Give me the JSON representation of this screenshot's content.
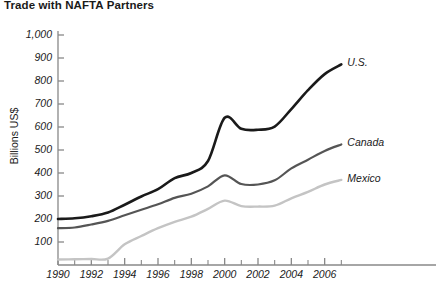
{
  "chart_data": {
    "type": "line",
    "title": "Trade with NAFTA Partners",
    "xlabel": "",
    "ylabel": "Billions US$",
    "xlim": [
      1990,
      2007.4
    ],
    "ylim": [
      0,
      1000
    ],
    "grid": false,
    "legend_position": "line-end-labels",
    "x_tick_labels": [
      "1990",
      "1992",
      "1994",
      "1996",
      "1998",
      "2000",
      "2002",
      "2004",
      "2006"
    ],
    "x_tick_values": [
      1990,
      1992,
      1994,
      1996,
      1998,
      2000,
      2002,
      2004,
      2006
    ],
    "x_minor_ticks": [
      1991,
      1993,
      1995,
      1997,
      1999,
      2001,
      2003,
      2005,
      2007
    ],
    "y_tick_labels": [
      "100",
      "200",
      "300",
      "400",
      "500",
      "600",
      "700",
      "800",
      "900",
      "1,000"
    ],
    "y_tick_values": [
      100,
      200,
      300,
      400,
      500,
      600,
      700,
      800,
      900,
      1000
    ],
    "x": [
      1990,
      1991,
      1992,
      1993,
      1994,
      1995,
      1996,
      1997,
      1998,
      1999,
      2000,
      2001,
      2002,
      2003,
      2004,
      2005,
      2006,
      2007
    ],
    "series": [
      {
        "name": "U.S.",
        "label": "U.S.",
        "color": "#1a1a1a",
        "width": 2.6,
        "values": [
          200,
          203,
          212,
          228,
          262,
          298,
          330,
          378,
          400,
          452,
          640,
          592,
          588,
          602,
          678,
          760,
          830,
          872
        ]
      },
      {
        "name": "Canada",
        "label": "Canada",
        "color": "#555555",
        "width": 2.2,
        "values": [
          160,
          163,
          176,
          192,
          216,
          240,
          264,
          292,
          310,
          342,
          390,
          352,
          350,
          368,
          420,
          458,
          496,
          524
        ]
      },
      {
        "name": "Mexico",
        "label": "Mexico",
        "color": "#c4c4c4",
        "width": 2.4,
        "values": [
          24,
          25,
          26,
          28,
          90,
          126,
          160,
          188,
          210,
          244,
          280,
          256,
          254,
          258,
          290,
          318,
          350,
          370
        ]
      }
    ],
    "colors": {
      "axis": "#888888",
      "text": "#1a1a1a",
      "us": "#1a1a1a",
      "canada": "#555555",
      "mexico": "#c4c4c4"
    }
  }
}
